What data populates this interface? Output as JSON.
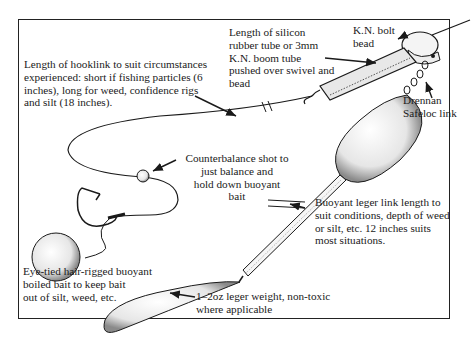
{
  "figure": {
    "type": "fishing rig diagram",
    "labels": {
      "hooklink": [
        "Length of hooklink to suit circumstances",
        "experienced: short if fishing particles (6",
        "inches), long for weed, confidence rigs",
        "and silt (18 inches)."
      ],
      "silicon_tube": [
        "Length of silicon",
        "rubber tube or 3mm",
        "K.N. boom tube",
        "pushed over swivel and",
        "bead"
      ],
      "bolt_bead": [
        "K.N. bolt",
        "bead"
      ],
      "drennan_link": [
        "Drennan",
        "Safeloc link"
      ],
      "counterbalance": [
        "Counterbalance shot to",
        "just balance and",
        "hold down buoyant",
        "bait"
      ],
      "leger_link": [
        "Buoyant leger link length to",
        "suit conditions, depth of weed",
        "or silt, etc. 12 inches suits",
        "most situations."
      ],
      "boilie": [
        "Eye-tied hair-rigged buoyant",
        "boiled bait to keep bait",
        "out of silt, weed, etc."
      ],
      "leger_weight": [
        "1–2oz leger weight, non-toxic",
        "where applicable"
      ]
    },
    "colors": {
      "ink": "#1a1a1a",
      "background": "#ffffff",
      "stipple": "#9a9a9a"
    }
  }
}
